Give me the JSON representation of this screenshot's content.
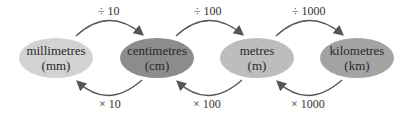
{
  "units": [
    {
      "name": "millimetres",
      "abbr": "(mm)",
      "color": "#d2d2d2"
    },
    {
      "name": "centimetres",
      "abbr": "(cm)",
      "color": "#8c8c8c"
    },
    {
      "name": "metres",
      "abbr": "(m)",
      "color": "#bdbdbd"
    },
    {
      "name": "kilometres",
      "abbr": "(km)",
      "color": "#a3a3a3"
    }
  ],
  "divide_labels": [
    "÷ 10",
    "÷ 100",
    "÷ 1000"
  ],
  "multiply_labels": [
    "× 10",
    "× 100",
    "× 1000"
  ],
  "arrow_color": "#555555"
}
